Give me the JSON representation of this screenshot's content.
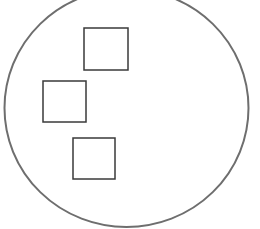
{
  "diagram": {
    "width": 260,
    "height": 229,
    "background": "#ffffff",
    "circle": {
      "cx": 126.5,
      "cy": 108,
      "rx": 122,
      "ry": 119,
      "stroke": "#6e6e6e",
      "stroke_width": 2
    },
    "squares": [
      {
        "name": "square-top",
        "x": 84,
        "y": 28,
        "width": 44,
        "height": 42,
        "stroke": "#3a3a3a",
        "stroke_width": 1.5
      },
      {
        "name": "square-middle",
        "x": 43,
        "y": 81,
        "width": 43,
        "height": 41,
        "stroke": "#3a3a3a",
        "stroke_width": 1.5
      },
      {
        "name": "square-bottom",
        "x": 73,
        "y": 138,
        "width": 42,
        "height": 41,
        "stroke": "#3a3a3a",
        "stroke_width": 1.5
      }
    ]
  }
}
